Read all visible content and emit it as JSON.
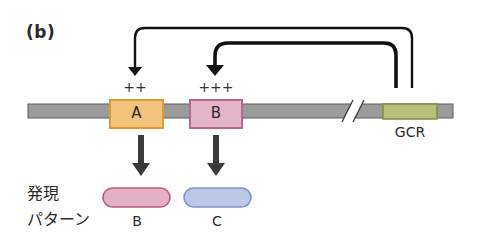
{
  "panel_label": "(b)",
  "regulation": {
    "gene_a_level": "++",
    "gene_b_level": "+++"
  },
  "genes": [
    {
      "id": "A",
      "label": "A",
      "color": "#f2c37c",
      "border": "#e09a30"
    },
    {
      "id": "B",
      "label": "B",
      "color": "#e4b4c8",
      "border": "#b8678c"
    }
  ],
  "regulator": {
    "label": "GCR",
    "color": "#b9bf7a",
    "border": "#7f8f3a"
  },
  "expression": {
    "title_line1": "発現",
    "title_line2": "パターン",
    "patterns": [
      {
        "label": "B",
        "color": "#e6b0c4",
        "border": "#b55a82"
      },
      {
        "label": "C",
        "color": "#bac7e6",
        "border": "#7f93c4"
      }
    ]
  },
  "colors": {
    "dna_fill": "#9b9b9b",
    "dna_edge": "#5c5c5c",
    "arrow": "#111111",
    "down_arrow": "#3a3a3a"
  }
}
